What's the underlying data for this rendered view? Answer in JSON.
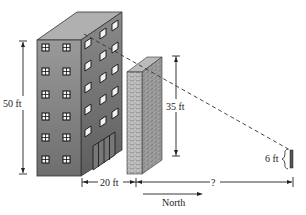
{
  "labels": {
    "building_height": "50 ft",
    "wall_height": "35 ft",
    "gap_distance": "20 ft",
    "unknown_distance": "?",
    "person_height": "6 ft",
    "direction": "North"
  },
  "colors": {
    "building_front": "#8a8a8a",
    "building_side": "#6f6f6f",
    "building_top": "#a9a9a9",
    "wall_front": "#9a9a9a",
    "wall_side": "#7a7a7a",
    "lines": "#222222"
  }
}
